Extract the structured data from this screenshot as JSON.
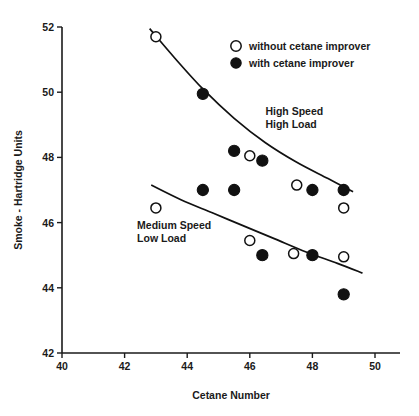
{
  "chart_data": {
    "type": "scatter",
    "title": "",
    "xlabel": "Cetane Number",
    "ylabel": "Smoke - Hartridge Units",
    "xlim": [
      40,
      50.8
    ],
    "ylim": [
      42,
      52
    ],
    "xticks": [
      40,
      42,
      44,
      46,
      48,
      50
    ],
    "yticks": [
      42,
      44,
      46,
      48,
      50,
      52
    ],
    "xtick_labels": [
      "40",
      "42",
      "44",
      "46",
      "48",
      "50"
    ],
    "ytick_labels": [
      "42",
      "44",
      "46",
      "48",
      "50",
      "52"
    ],
    "grid": false,
    "legend_position": "top-right",
    "legend": [
      {
        "label": "without cetane improver",
        "marker": "open-circle"
      },
      {
        "label": "with cetane improver",
        "marker": "filled-circle"
      }
    ],
    "annotations": [
      {
        "text_line1": "High Speed",
        "text_line2": "High Load",
        "x": 46.5,
        "y": 49.3
      },
      {
        "text_line1": "Medium Speed",
        "text_line2": "Low Load",
        "x": 42.4,
        "y": 45.8
      }
    ],
    "series": [
      {
        "name": "without cetane improver",
        "group": "High Speed High Load",
        "marker": "open-circle",
        "points": [
          {
            "x": 43.0,
            "y": 51.7
          },
          {
            "x": 46.0,
            "y": 48.05
          },
          {
            "x": 47.5,
            "y": 47.15
          },
          {
            "x": 49.0,
            "y": 46.45
          }
        ]
      },
      {
        "name": "with cetane improver",
        "group": "High Speed High Load",
        "marker": "filled-circle",
        "points": [
          {
            "x": 44.5,
            "y": 49.95
          },
          {
            "x": 45.5,
            "y": 48.2
          },
          {
            "x": 46.4,
            "y": 47.9
          },
          {
            "x": 48.0,
            "y": 47.0
          },
          {
            "x": 49.0,
            "y": 47.0
          }
        ]
      },
      {
        "name": "without cetane improver",
        "group": "Medium Speed Low Load",
        "marker": "open-circle",
        "points": [
          {
            "x": 43.0,
            "y": 46.45
          },
          {
            "x": 46.0,
            "y": 45.45
          },
          {
            "x": 47.4,
            "y": 45.05
          },
          {
            "x": 49.0,
            "y": 44.95
          }
        ]
      },
      {
        "name": "with cetane improver",
        "group": "Medium Speed Low Load",
        "marker": "filled-circle",
        "points": [
          {
            "x": 44.5,
            "y": 47.0
          },
          {
            "x": 45.5,
            "y": 47.0
          },
          {
            "x": 46.4,
            "y": 45.0
          },
          {
            "x": 48.0,
            "y": 45.0
          },
          {
            "x": 49.0,
            "y": 43.8
          }
        ]
      }
    ],
    "trend_lines": [
      {
        "name": "High Speed High Load trend",
        "points": [
          {
            "x": 42.8,
            "y": 51.95
          },
          {
            "x": 43.6,
            "y": 51.05
          },
          {
            "x": 44.5,
            "y": 50.1
          },
          {
            "x": 45.5,
            "y": 49.2
          },
          {
            "x": 46.5,
            "y": 48.45
          },
          {
            "x": 47.5,
            "y": 47.85
          },
          {
            "x": 48.5,
            "y": 47.35
          },
          {
            "x": 49.3,
            "y": 46.95
          }
        ]
      },
      {
        "name": "Medium Speed Low Load trend",
        "points": [
          {
            "x": 42.85,
            "y": 47.15
          },
          {
            "x": 43.8,
            "y": 46.7
          },
          {
            "x": 44.8,
            "y": 46.3
          },
          {
            "x": 45.8,
            "y": 45.9
          },
          {
            "x": 46.8,
            "y": 45.5
          },
          {
            "x": 47.8,
            "y": 45.1
          },
          {
            "x": 48.8,
            "y": 44.75
          },
          {
            "x": 49.6,
            "y": 44.45
          }
        ]
      }
    ]
  },
  "labels": {
    "x_axis_title": "Cetane Number",
    "y_axis_title": "Smoke - Hartridge Units",
    "legend_without": "without cetane improver",
    "legend_with": "with cetane improver",
    "annot_high_1": "High Speed",
    "annot_high_2": "High Load",
    "annot_med_1": "Medium Speed",
    "annot_med_2": "Low Load"
  },
  "colors": {
    "axis": "#1a1a1a",
    "marker_fill": "#111111",
    "marker_open": "#ffffff",
    "background": "#ffffff"
  }
}
